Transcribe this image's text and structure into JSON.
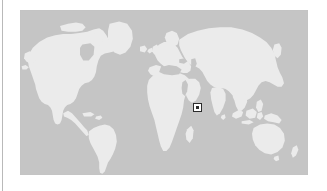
{
  "figure": {
    "name": "world-locator-map",
    "type": "world-locator-map",
    "projection": "equirectangular",
    "ocean_color": "#c5c5c5",
    "land_color": "#ebebeb",
    "background_color": "#ffffff",
    "margin_rule_color": "#b9b9b9",
    "caption": "",
    "bounds": {
      "left_px": 20,
      "top_px": 10,
      "width_px": 288,
      "height_px": 165,
      "lon_min": -180,
      "lon_max": 180,
      "lat_min": -60,
      "lat_max": 84
    }
  },
  "marker": {
    "name": "study-area-marker",
    "shape": "square-outline-with-center-dot",
    "color": "#2b2b2b",
    "fill": "#ffffff",
    "size_px": 9,
    "x_px": 193,
    "y_px": 103,
    "region_label": "",
    "approx_lon": 41,
    "approx_lat": 10
  },
  "landmasses": [
    {
      "name": "north-america"
    },
    {
      "name": "greenland"
    },
    {
      "name": "south-america"
    },
    {
      "name": "europe"
    },
    {
      "name": "africa"
    },
    {
      "name": "asia"
    },
    {
      "name": "australia"
    },
    {
      "name": "madagascar"
    },
    {
      "name": "great-britain"
    },
    {
      "name": "japan"
    },
    {
      "name": "new-zealand"
    },
    {
      "name": "indonesia"
    },
    {
      "name": "philippines"
    },
    {
      "name": "iceland"
    },
    {
      "name": "new-guinea"
    },
    {
      "name": "sri-lanka"
    },
    {
      "name": "cuba"
    }
  ]
}
